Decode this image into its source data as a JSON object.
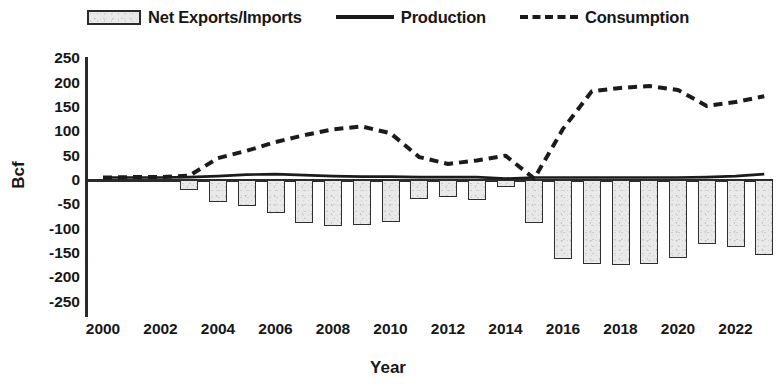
{
  "legend": {
    "items": [
      {
        "label": "Net Exports/Imports",
        "marker": "bar-swatch-icon"
      },
      {
        "label": "Production",
        "marker": "solid-line-icon"
      },
      {
        "label": "Consumption",
        "marker": "dashed-line-icon"
      }
    ]
  },
  "axes": {
    "y_title": "Bcf",
    "x_title": "Year",
    "y_ticks": [
      "250",
      "200",
      "150",
      "100",
      "50",
      "0",
      "-50",
      "-100",
      "-150",
      "-200",
      "-250"
    ],
    "x_ticks": [
      "2000",
      "2002",
      "2004",
      "2006",
      "2008",
      "2010",
      "2012",
      "2014",
      "2016",
      "2018",
      "2020",
      "2022"
    ]
  },
  "colors": {
    "bar_fill": "#e9e9e9",
    "bar_stroke": "#2e2e2e",
    "line": "#1b1b1b",
    "axis": "#2b2b2b",
    "text": "#171717"
  },
  "chart_data": {
    "type": "bar",
    "title": "",
    "xlabel": "Year",
    "ylabel": "Bcf",
    "ylim": [
      -250,
      250
    ],
    "xlim": [
      2000,
      2023
    ],
    "grid": false,
    "legend_position": "top",
    "categories": [
      2000,
      2001,
      2002,
      2003,
      2004,
      2005,
      2006,
      2007,
      2008,
      2009,
      2010,
      2011,
      2012,
      2013,
      2014,
      2015,
      2016,
      2017,
      2018,
      2019,
      2020,
      2021,
      2022,
      2023
    ],
    "series": [
      {
        "name": "Net Exports/Imports",
        "type": "bar",
        "values": [
          0,
          0,
          0,
          -20,
          -45,
          -53,
          -68,
          -88,
          -95,
          -93,
          -86,
          -40,
          -35,
          -42,
          -14,
          -88,
          -163,
          -172,
          -175,
          -172,
          -160,
          -132,
          -137,
          -155
        ]
      },
      {
        "name": "Production",
        "type": "line",
        "style": "solid",
        "values": [
          5,
          5,
          5,
          6,
          8,
          11,
          12,
          10,
          8,
          7,
          7,
          6,
          6,
          6,
          3,
          5,
          5,
          5,
          5,
          5,
          5,
          6,
          8,
          12
        ]
      },
      {
        "name": "Consumption",
        "type": "line",
        "style": "dashed",
        "values": [
          5,
          6,
          6,
          9,
          45,
          60,
          78,
          92,
          104,
          110,
          96,
          47,
          33,
          40,
          50,
          3,
          105,
          182,
          189,
          193,
          185,
          152,
          160,
          172
        ]
      }
    ]
  }
}
